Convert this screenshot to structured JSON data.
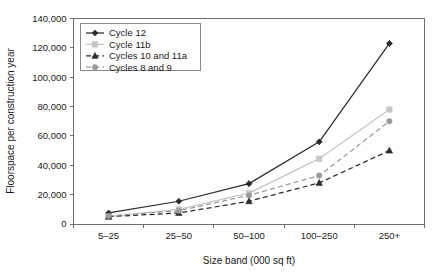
{
  "chart_data": {
    "type": "line",
    "title": "",
    "xlabel": "Size band (000 sq ft)",
    "ylabel": "Floorspace per construction year",
    "categories": [
      "5–25",
      "25–50",
      "50–100",
      "100–250",
      "250+"
    ],
    "ylim": [
      0,
      140000
    ],
    "ytick_labels": [
      "0",
      "20,000",
      "40,000",
      "60,000",
      "80,000",
      "100,000",
      "120,000",
      "140,000"
    ],
    "ytick_values": [
      0,
      20000,
      40000,
      60000,
      80000,
      100000,
      120000,
      140000
    ],
    "grid": false,
    "legend_position": "top-left",
    "series": [
      {
        "name": "Cycle 12",
        "values": [
          7500,
          15500,
          27500,
          56000,
          123000
        ],
        "color": "#2b2b2b",
        "marker": "diamond",
        "dash": "none"
      },
      {
        "name": "Cycle 11b",
        "values": [
          5000,
          10000,
          21000,
          44500,
          78000
        ],
        "color": "#c6c6c6",
        "marker": "square",
        "dash": "none"
      },
      {
        "name": "Cycles 10 and 11a",
        "values": [
          5000,
          7500,
          15500,
          28000,
          50000
        ],
        "color": "#2b2b2b",
        "marker": "triangle",
        "dash": "dashed"
      },
      {
        "name": "Cycles 8 and 9",
        "values": [
          5500,
          9000,
          19500,
          33000,
          70000
        ],
        "color": "#9a9a9a",
        "marker": "circle",
        "dash": "dashed"
      }
    ]
  },
  "legend": {
    "entries": [
      {
        "label": "Cycle 12"
      },
      {
        "label": "Cycle 11b"
      },
      {
        "label": "Cycles 10 and 11a"
      },
      {
        "label": "Cycles 8 and 9"
      }
    ]
  },
  "axes": {
    "x_title": "Size band (000 sq ft)",
    "y_title": "Floorspace per construction year",
    "x_labels": [
      "5–25",
      "25–50",
      "50–100",
      "100–250",
      "250+"
    ],
    "y_labels": [
      "0",
      "20,000",
      "40,000",
      "60,000",
      "80,000",
      "100,000",
      "120,000",
      "140,000"
    ]
  },
  "colors": {
    "axis": "#6d6d6d",
    "text": "#1a1a1a",
    "series_dark": "#2b2b2b",
    "series_light_gray": "#c6c6c6",
    "series_mid_gray": "#9a9a9a",
    "background": "#ffffff"
  }
}
